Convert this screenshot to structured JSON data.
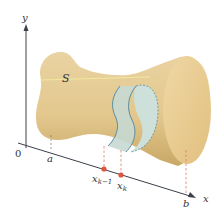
{
  "diagram": {
    "type": "solid-volume-slicing",
    "labels": {
      "y_axis": "y",
      "x_axis": "x",
      "origin": "0",
      "solid": "S",
      "a": "a",
      "b": "b",
      "x_prev": "x",
      "x_prev_sub": "k−1",
      "x_k": "x",
      "x_k_sub": "k"
    },
    "colors": {
      "solid_fill": "#e6c98e",
      "solid_shade": "#d4b170",
      "end_cap_fill": "#edd29a",
      "slab_fill": "#c7d9d3",
      "slab_stroke": "#5b8ea3",
      "axis": "#3a3f4a",
      "dash": "#e07a6a",
      "point": "#e0553b",
      "center_line": "#f3e7a0"
    }
  }
}
